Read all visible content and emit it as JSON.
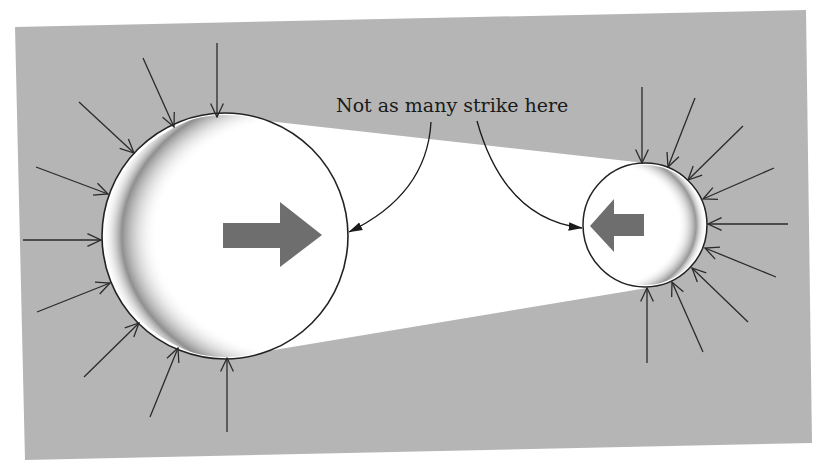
{
  "figure": {
    "annotation": "Not as many strike here",
    "colors": {
      "background": "#ffffff",
      "panel": "#b5b5b5",
      "band": "#ffffff",
      "sphere_fill": "#ffffff",
      "sphere_outline": "#222222",
      "motion_arrow": "#6e6e6e",
      "strike_line": "#2a2a2a",
      "shading": "#555555"
    },
    "large_sphere": {
      "center": [
        225,
        236
      ],
      "radius": 123,
      "motion_direction": "right",
      "strike_count": 9
    },
    "small_sphere": {
      "center": [
        645,
        225
      ],
      "radius": 62,
      "motion_direction": "left",
      "strike_count": 9
    }
  }
}
